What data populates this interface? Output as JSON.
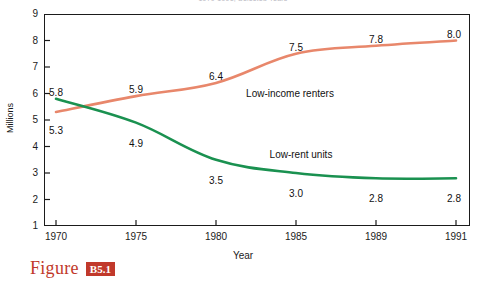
{
  "chart_data": {
    "type": "line",
    "title": "1970-1991, Selected Years",
    "xlabel": "Year",
    "ylabel": "Millions",
    "categories": [
      "1970",
      "1975",
      "1980",
      "1985",
      "1989",
      "1991"
    ],
    "ylim": [
      1,
      9
    ],
    "y_ticks": [
      "9",
      "8",
      "7",
      "6",
      "5",
      "4",
      "3",
      "2",
      "1"
    ],
    "grid": false,
    "legend_position": "inline-annotations",
    "series": [
      {
        "name": "Low-income renters",
        "color": "#E8876B",
        "values": [
          5.3,
          5.9,
          6.4,
          7.5,
          7.8,
          8.0
        ],
        "value_labels": [
          "5.3",
          "5.9",
          "6.4",
          "7.5",
          "7.8",
          "8.0"
        ]
      },
      {
        "name": "Low-rent units",
        "color": "#1A9150",
        "values": [
          5.8,
          4.9,
          3.5,
          3.0,
          2.8,
          2.8
        ],
        "value_labels": [
          "5.8",
          "4.9",
          "3.5",
          "3.0",
          "2.8",
          "2.8"
        ]
      }
    ]
  },
  "caption": {
    "word": "Figure",
    "number": "B5.1",
    "accent_color": "#C1392B"
  }
}
